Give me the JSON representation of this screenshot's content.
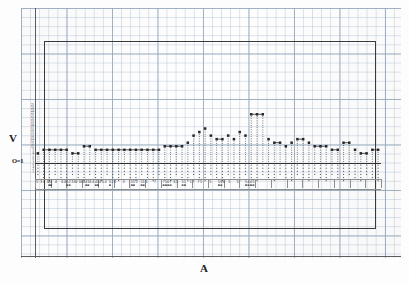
{
  "figure": {
    "kind": "scanned-graph-paper-plot",
    "background_color": "#fdfdfd",
    "grid_color": "#bacad8",
    "grid_major_color": "#96aabe",
    "ink_color": "#2e2e2e",
    "frame_color": "#3a3a3a"
  },
  "axes": {
    "y_label": "V",
    "x_label": "A",
    "origin_label": "O=1",
    "y_tick_labels": [
      "25",
      "24",
      "23",
      "22",
      "21",
      "20",
      "19",
      "18",
      "17",
      "16",
      "15",
      "14",
      "13",
      "12",
      "11",
      "10",
      "9",
      "8",
      "7",
      "6",
      "5",
      "4",
      "3",
      "2",
      "1"
    ],
    "baseline_value": 1,
    "ylim": [
      0,
      26
    ],
    "grid_on": true,
    "legend": "none"
  },
  "chart_data": {
    "type": "bar",
    "title": "",
    "subtitle": "",
    "xlabel": "A",
    "ylabel": "V",
    "ylim": [
      0,
      26
    ],
    "grid": true,
    "legend_position": "none",
    "note": "Dotted vertical stems with square markers at the top; horizontal connector segments link equal-height neighbours. Heights read off the tiny y tick column, baseline at O=1.",
    "categories": [
      "5",
      "2",
      "4",
      "2",
      "3",
      "34",
      "4",
      "4",
      "4",
      "5",
      "5",
      "2",
      "3",
      "3",
      "4",
      "4",
      "4",
      "4",
      "3",
      "4",
      "4",
      "4",
      "3",
      "4",
      "5",
      "4",
      "5",
      "2",
      "2",
      "3",
      "3",
      "5",
      "1",
      "2",
      "5",
      "1",
      "6",
      "7",
      "7",
      "5",
      "6",
      "7",
      "6",
      "5",
      "5",
      "1",
      "1",
      "7",
      "7",
      "5",
      "5",
      "5",
      "6",
      "6",
      "5",
      "5",
      "5",
      "4",
      "4",
      "5"
    ],
    "values": [
      3,
      4,
      4,
      4,
      4,
      4,
      3,
      3,
      5,
      5,
      4,
      4,
      4,
      4,
      4,
      4,
      4,
      4,
      4,
      4,
      4,
      4,
      5,
      5,
      5,
      5,
      6,
      8,
      9,
      10,
      8,
      7,
      7,
      8,
      7,
      9,
      8,
      14,
      14,
      14,
      7,
      6,
      6,
      5,
      6,
      7,
      7,
      6,
      5,
      5,
      5,
      4,
      4,
      6,
      6,
      4,
      3,
      3,
      4,
      4
    ],
    "x_tick_labels": [
      {
        "text": "5",
        "x": 2.2,
        "underline": false
      },
      {
        "text": "3 4",
        "x": 7.6,
        "underline": false
      },
      {
        "text": "3",
        "x": 12.6,
        "underline": false
      },
      {
        "text": "34",
        "x": 15.2,
        "underline": true
      },
      {
        "text": "4",
        "x": 21.0,
        "underline": false
      },
      {
        "text": "4",
        "x": 27.1,
        "underline": false
      },
      {
        "text": "4",
        "x": 29.8,
        "underline": false
      },
      {
        "text": "5",
        "x": 32.2,
        "underline": true
      },
      {
        "text": "2",
        "x": 34.6,
        "underline": true
      },
      {
        "text": "3",
        "x": 37.5,
        "underline": false
      },
      {
        "text": "34",
        "x": 40.6,
        "underline": false
      },
      {
        "text": "34",
        "x": 45.7,
        "underline": false
      },
      {
        "text": "4",
        "x": 48.8,
        "underline": false
      },
      {
        "text": "4",
        "x": 51.2,
        "underline": true
      },
      {
        "text": "3",
        "x": 53.3,
        "underline": true
      },
      {
        "text": "4",
        "x": 55.5,
        "underline": false
      },
      {
        "text": "4",
        "x": 58.2,
        "underline": false
      },
      {
        "text": "4",
        "x": 60.8,
        "underline": true
      },
      {
        "text": "3",
        "x": 62.9,
        "underline": true
      },
      {
        "text": "4",
        "x": 65.1,
        "underline": false
      },
      {
        "text": "5",
        "x": 68.0,
        "underline": false
      },
      {
        "text": "4",
        "x": 70.6,
        "underline": false
      },
      {
        "text": "5",
        "x": 75.0,
        "underline": true
      },
      {
        "text": "2",
        "x": 77.3,
        "underline": false
      },
      {
        "text": "3",
        "x": 80.0,
        "underline": false
      },
      {
        "text": "3",
        "x": 88.6,
        "underline": false
      },
      {
        "text": "5",
        "x": 96.9,
        "underline": true
      },
      {
        "text": "1",
        "x": 99.0,
        "underline": true
      },
      {
        "text": "2",
        "x": 101.8,
        "underline": false
      },
      {
        "text": "5",
        "x": 106.6,
        "underline": true
      },
      {
        "text": "1",
        "x": 108.7,
        "underline": true
      },
      {
        "text": "6",
        "x": 111.3,
        "underline": false
      },
      {
        "text": "7",
        "x": 119.9,
        "underline": false
      },
      {
        "text": "7",
        "x": 128.6,
        "underline": true
      },
      {
        "text": "5",
        "x": 130.9,
        "underline": true
      },
      {
        "text": "6",
        "x": 133.2,
        "underline": true
      },
      {
        "text": "7",
        "x": 135.6,
        "underline": true
      },
      {
        "text": "6",
        "x": 139.3,
        "underline": false
      },
      {
        "text": "5",
        "x": 142.0,
        "underline": false
      },
      {
        "text": "5",
        "x": 147.6,
        "underline": true
      },
      {
        "text": "1",
        "x": 150.0,
        "underline": true
      },
      {
        "text": "1",
        "x": 155.6,
        "underline": false
      },
      {
        "text": "7",
        "x": 158.3,
        "underline": false
      },
      {
        "text": "7",
        "x": 163.4,
        "underline": false
      },
      {
        "text": "5",
        "x": 166.1,
        "underline": false
      },
      {
        "text": "5",
        "x": 175.5,
        "underline": false
      },
      {
        "text": "5",
        "x": 183.9,
        "underline": true
      },
      {
        "text": "6",
        "x": 186.3,
        "underline": true
      },
      {
        "text": "6",
        "x": 189.0,
        "underline": false
      },
      {
        "text": "5",
        "x": 194.3,
        "underline": false
      },
      {
        "text": "5",
        "x": 202.6,
        "underline": false
      },
      {
        "text": "5",
        "x": 211.0,
        "underline": true
      },
      {
        "text": "4",
        "x": 213.4,
        "underline": true
      },
      {
        "text": "4",
        "x": 216.0,
        "underline": true
      },
      {
        "text": "5",
        "x": 218.4,
        "underline": true
      }
    ]
  }
}
